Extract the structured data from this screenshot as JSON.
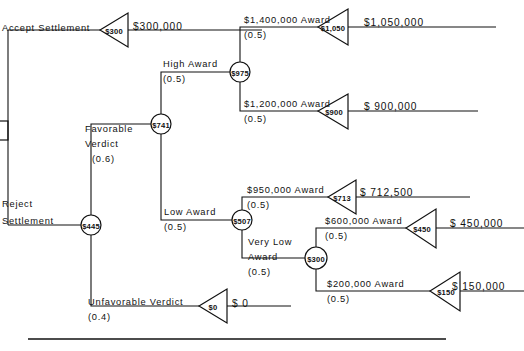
{
  "diagram": {
    "type": "decision-tree",
    "decision_node": {
      "value": ""
    },
    "branches": {
      "accept_settlement": {
        "label": "Accept Settlement",
        "payoff": "$300,000",
        "endpoint_value": "$300"
      },
      "reject_settlement": {
        "label": "Reject\nSettlement",
        "label_line1": "Reject",
        "label_line2": "Settlement",
        "node_value": "$445"
      },
      "favorable_verdict": {
        "label_line1": "Favorable",
        "label_line2": "Verdict",
        "probability": "(0.6)",
        "node_value": "$741"
      },
      "unfavorable_verdict": {
        "label": "Unfavorable  Verdict",
        "probability": "(0.4)",
        "payoff": "$ 0",
        "endpoint_value": "$0"
      },
      "high_award": {
        "label": "High Award",
        "probability": "(0.5)",
        "node_value": "$975"
      },
      "low_award": {
        "label": "Low Award",
        "probability": "(0.5)",
        "node_value": "$507"
      },
      "award_1400": {
        "label": "$1,400,000 Award",
        "probability": "(0.5)",
        "payoff": "$1,050,000",
        "endpoint_value": "$1,050"
      },
      "award_1200": {
        "label": "$1,200,000 Award",
        "probability": "(0.5)",
        "payoff": "$ 900,000",
        "endpoint_value": "$900"
      },
      "award_950": {
        "label": "$950,000 Award",
        "probability": "(0.5)",
        "payoff": "$ 712,500",
        "endpoint_value": "$713"
      },
      "very_low_award": {
        "label_line1": "Very Low",
        "label_line2": "Award",
        "probability": "(0.5)",
        "node_value": "$300"
      },
      "award_600": {
        "label": "$600,000 Award",
        "probability": "(0.5)",
        "payoff": "$ 450,000",
        "endpoint_value": "$450"
      },
      "award_200": {
        "label": "$200,000 Award",
        "probability": "(0.5)",
        "payoff": "$ 150,000",
        "endpoint_value": "$150"
      }
    },
    "colors": {
      "ink": "#111111",
      "background": "#ffffff"
    }
  }
}
